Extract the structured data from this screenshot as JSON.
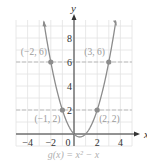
{
  "chart_data": {
    "type": "line",
    "title": "",
    "caption": "g(x) = x² − x",
    "function": "x^2 - x",
    "xlabel": "x",
    "ylabel": "y",
    "xlim": [
      -5,
      5
    ],
    "ylim": [
      -1,
      9.5
    ],
    "grid": true,
    "x_ticks": [
      -4,
      -2,
      0,
      2,
      4
    ],
    "y_ticks": [
      2,
      4,
      6,
      8
    ],
    "x_tick_labels": [
      "−4",
      "−2",
      "0",
      "2",
      "4"
    ],
    "y_tick_labels": [
      "2",
      "4",
      "6",
      "8"
    ],
    "series": [
      {
        "name": "g(x) = x^2 - x",
        "x": [
          -2.6,
          -2,
          -1,
          0,
          0.5,
          1,
          2,
          3,
          3.6
        ],
        "y": [
          9.36,
          6,
          2,
          0,
          -0.25,
          0,
          2,
          6,
          9.36
        ]
      }
    ],
    "points": [
      {
        "x": -2,
        "y": 6,
        "label": "(−2, 6)"
      },
      {
        "x": 3,
        "y": 6,
        "label": "(3, 6)"
      },
      {
        "x": -1,
        "y": 2,
        "label": "(−1, 2)"
      },
      {
        "x": 2,
        "y": 2,
        "label": "(2, 2)"
      }
    ],
    "dashed_reference_lines_y": [
      6,
      2
    ],
    "colors": {
      "curve": "#8c8c8c",
      "points": "#8c8c8c",
      "grid": "#e2e2e2",
      "dashed": "#bdbdbd",
      "axes": "#333333",
      "labels": "#9a9a9a"
    }
  }
}
